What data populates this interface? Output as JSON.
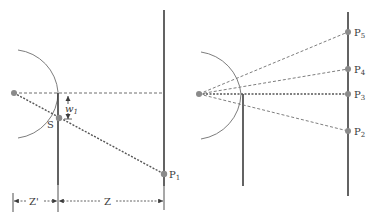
{
  "colors": {
    "line": "#3c3c3c",
    "dashed": "#6f6f6f",
    "arc": "#7d7d7d",
    "point": "#8a8a8a"
  },
  "left_panel": {
    "source_label": "",
    "slit_label": "S",
    "offset_label": "w",
    "offset_subscript": "1",
    "point_label": "P",
    "point_subscript": "1",
    "dimension_near": "Z'",
    "dimension_far": "Z"
  },
  "right_panel": {
    "points": [
      {
        "label": "P",
        "sub": "5"
      },
      {
        "label": "P",
        "sub": "4"
      },
      {
        "label": "P",
        "sub": "3"
      },
      {
        "label": "P",
        "sub": "2"
      }
    ]
  }
}
